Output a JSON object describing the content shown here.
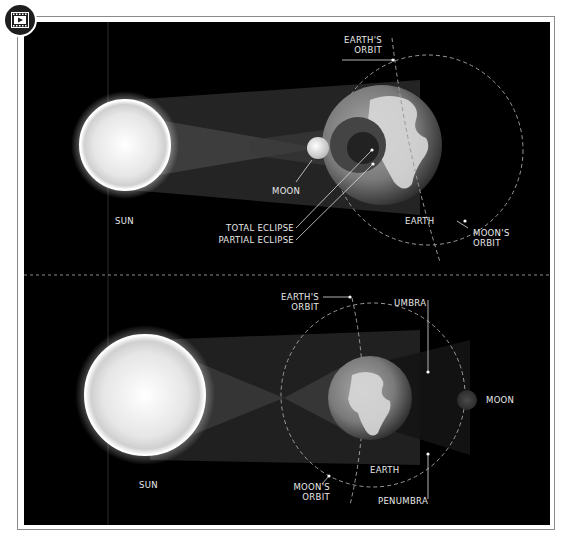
{
  "badge": {
    "icon": "video-play-icon"
  },
  "colors": {
    "background": "#000000",
    "frame": "#8a8a8a",
    "label": "#e8e8e8",
    "orbit": "#9a9a9a"
  },
  "top_panel": {
    "title": "Solar eclipse",
    "labels": {
      "earths_orbit_1": "EARTH'S",
      "earths_orbit_2": "ORBIT",
      "moon": "MOON",
      "sun": "SUN",
      "total_eclipse": "TOTAL ECLIPSE",
      "partial_eclipse": "PARTIAL ECLIPSE",
      "earth": "EARTH",
      "moons_orbit_1": "MOON'S",
      "moons_orbit_2": "ORBIT"
    }
  },
  "bottom_panel": {
    "title": "Lunar eclipse",
    "labels": {
      "earths_orbit_1": "EARTH'S",
      "earths_orbit_2": "ORBIT",
      "umbra": "UMBRA",
      "moon": "MOON",
      "sun": "SUN",
      "moons_orbit_1": "MOON'S",
      "moons_orbit_2": "ORBIT",
      "earth": "EARTH",
      "penumbra": "PENUMBRA"
    }
  }
}
